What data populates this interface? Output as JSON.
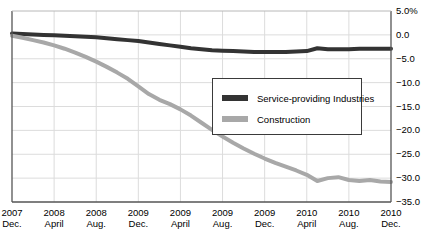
{
  "chart_data": {
    "type": "line",
    "title": "",
    "xlabel": "",
    "ylabel": "",
    "ylim": [
      -35.0,
      5.0
    ],
    "grid": true,
    "legend_position": "center-right",
    "y_ticks": [
      "5.0%",
      "0.0",
      "-5.0",
      "-10.0",
      "-15.0",
      "-20.0",
      "-25.0",
      "-30.0",
      "-35.0"
    ],
    "y_tick_values": [
      5.0,
      0.0,
      -5.0,
      -10.0,
      -15.0,
      -20.0,
      -25.0,
      -30.0,
      -35.0
    ],
    "x_ticks": [
      {
        "year": "2007",
        "month": "Dec."
      },
      {
        "year": "2008",
        "month": "April"
      },
      {
        "year": "2008",
        "month": "Aug."
      },
      {
        "year": "2009",
        "month": "Dec."
      },
      {
        "year": "2009",
        "month": "April"
      },
      {
        "year": "2009",
        "month": "Aug."
      },
      {
        "year": "2009",
        "month": "Dec."
      },
      {
        "year": "2010",
        "month": "April"
      },
      {
        "year": "2010",
        "month": "Aug."
      },
      {
        "year": "2010",
        "month": "Dec."
      }
    ],
    "x": [
      0,
      1,
      2,
      3,
      4,
      5,
      6,
      7,
      8,
      9,
      10,
      11,
      12,
      13,
      14,
      15,
      16,
      17,
      18,
      19,
      20,
      21,
      22,
      23,
      24,
      25,
      26,
      27,
      28,
      29,
      30,
      31,
      32,
      33,
      34,
      35,
      36
    ],
    "series": [
      {
        "name": "Service-providing Industries",
        "color": "#333333",
        "values": [
          0.3,
          0.2,
          0.1,
          0.0,
          -0.1,
          -0.2,
          -0.3,
          -0.4,
          -0.5,
          -0.7,
          -0.9,
          -1.1,
          -1.3,
          -1.6,
          -1.9,
          -2.2,
          -2.5,
          -2.8,
          -3.0,
          -3.2,
          -3.3,
          -3.4,
          -3.5,
          -3.6,
          -3.6,
          -3.6,
          -3.6,
          -3.5,
          -3.4,
          -2.8,
          -3.0,
          -3.0,
          -3.0,
          -2.9,
          -2.9,
          -2.9,
          -2.9
        ]
      },
      {
        "name": "Construction",
        "color": "#a8a8a8",
        "values": [
          -0.2,
          -0.6,
          -1.1,
          -1.6,
          -2.2,
          -2.9,
          -3.7,
          -4.6,
          -5.6,
          -6.7,
          -7.9,
          -9.2,
          -10.8,
          -12.4,
          -13.6,
          -14.5,
          -15.6,
          -16.9,
          -18.4,
          -19.9,
          -21.3,
          -22.6,
          -23.8,
          -24.9,
          -25.9,
          -26.8,
          -27.6,
          -28.4,
          -29.3,
          -30.6,
          -30.0,
          -29.8,
          -30.4,
          -30.6,
          -30.4,
          -30.7,
          -30.8
        ]
      }
    ]
  },
  "legend": {
    "items": [
      {
        "label": "Service-providing Industries",
        "color": "#333333"
      },
      {
        "label": "Construction",
        "color": "#a8a8a8"
      }
    ]
  },
  "axes": {
    "plot_left": 12,
    "plot_right": 391,
    "plot_top": 11,
    "plot_bottom": 202
  }
}
